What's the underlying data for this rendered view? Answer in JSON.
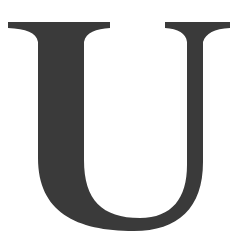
{
  "glyph": {
    "character": "U",
    "fill_color": "#3a3a3a",
    "background_color": "#ffffff"
  }
}
